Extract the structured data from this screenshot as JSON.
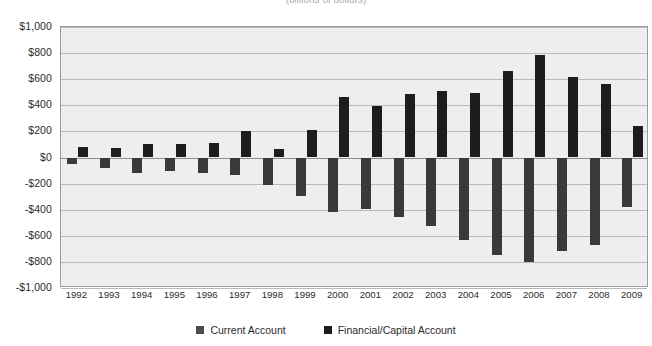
{
  "chart_data": {
    "type": "bar",
    "title": "",
    "subtitle": "",
    "xlabel": "",
    "ylabel": "",
    "ylim": [
      -1000,
      1000
    ],
    "ytick_step": 200,
    "grid": true,
    "legend_position": "bottom",
    "categories": [
      "1992",
      "1993",
      "1994",
      "1995",
      "1996",
      "1997",
      "1998",
      "1999",
      "2000",
      "2001",
      "2002",
      "2003",
      "2004",
      "2005",
      "2006",
      "2007",
      "2008",
      "2009"
    ],
    "series": [
      {
        "name": "Current Account",
        "color": "#3a3a3a",
        "values": [
          -50,
          -82,
          -122,
          -106,
          -121,
          -136,
          -210,
          -297,
          -416,
          -397,
          -459,
          -522,
          -631,
          -749,
          -803,
          -718,
          -669,
          -378
        ]
      },
      {
        "name": "Financial/Capital Account",
        "color": "#1d1d1d",
        "values": [
          80,
          72,
          105,
          101,
          112,
          201,
          62,
          208,
          463,
          391,
          485,
          508,
          497,
          661,
          786,
          617,
          562,
          241
        ]
      }
    ],
    "ytick_labels": [
      "$1,000",
      "$800",
      "$600",
      "$400",
      "$200",
      "$0",
      "-$200",
      "-$400",
      "-$600",
      "-$800",
      "-$1,000"
    ],
    "ytick_values": [
      1000,
      800,
      600,
      400,
      200,
      0,
      -200,
      -400,
      -600,
      -800,
      -1000
    ]
  },
  "legend": {
    "items": [
      {
        "label": "Current Account",
        "color": "#4a4a4a"
      },
      {
        "label": "Financial/Capital Account",
        "color": "#1d1d1d"
      }
    ]
  },
  "title_clipped": "(billions of dollars)",
  "footnote_clipped": ""
}
